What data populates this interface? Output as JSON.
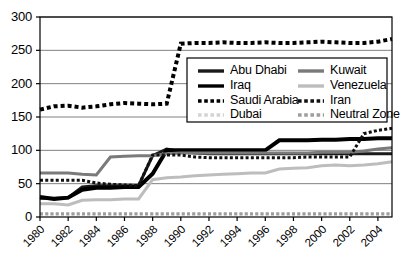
{
  "chart_data": {
    "type": "line",
    "title": "",
    "xlabel": "",
    "ylabel": "",
    "xlim": [
      1980,
      2005
    ],
    "ylim": [
      0,
      300
    ],
    "grid": true,
    "grid_axis": "y",
    "legend_position": "upper-center-right",
    "yticks": [
      "0",
      "50",
      "100",
      "150",
      "200",
      "250",
      "300"
    ],
    "ytick_values": [
      0,
      50,
      100,
      150,
      200,
      250,
      300
    ],
    "xticks": [
      "1980",
      "1982",
      "1984",
      "1986",
      "1988",
      "1990",
      "1992",
      "1994",
      "1996",
      "1998",
      "2000",
      "2002",
      "2004"
    ],
    "xtick_values": [
      1980,
      1982,
      1984,
      1986,
      1988,
      1990,
      1992,
      1994,
      1996,
      1998,
      2000,
      2002,
      2004
    ],
    "x": [
      1980,
      1981,
      1982,
      1983,
      1984,
      1985,
      1986,
      1987,
      1988,
      1989,
      1990,
      1991,
      1992,
      1993,
      1994,
      1995,
      1996,
      1997,
      1998,
      1999,
      2000,
      2001,
      2002,
      2003,
      2004,
      2005
    ],
    "series": [
      {
        "name": "Abu Dhabi",
        "color": "#1a1a1a",
        "style": "solid",
        "width": 3,
        "values": [
          28,
          28,
          29,
          45,
          47,
          47,
          47,
          47,
          92,
          102,
          98,
          96,
          95,
          95,
          95,
          95,
          95,
          95,
          95,
          95,
          95,
          95,
          95,
          95,
          95,
          95
        ]
      },
      {
        "name": "Iraq",
        "color": "#000000",
        "style": "solid",
        "width": 4,
        "values": [
          30,
          27,
          29,
          41,
          44,
          44,
          45,
          45,
          65,
          100,
          100,
          100,
          100,
          100,
          100,
          100,
          100,
          115,
          115,
          115,
          116,
          116,
          117,
          117,
          118,
          118
        ]
      },
      {
        "name": "Saudi Arabia",
        "color": "#000000",
        "style": "dotted",
        "width": 4,
        "values": [
          161,
          166,
          167,
          164,
          166,
          169,
          171,
          170,
          169,
          170,
          260,
          261,
          261,
          262,
          261,
          261,
          262,
          261,
          261,
          262,
          263,
          262,
          261,
          261,
          263,
          267
        ]
      },
      {
        "name": "Dubai",
        "color": "#d4d4d4",
        "style": "dotted",
        "width": 3,
        "values": [
          4,
          4,
          4,
          4,
          4,
          4,
          4,
          4,
          4,
          4,
          4,
          4,
          4,
          4,
          4,
          4,
          4,
          4,
          4,
          4,
          4,
          4,
          4,
          4,
          4,
          4
        ]
      },
      {
        "name": "Kuwait",
        "color": "#7a7a7a",
        "style": "solid",
        "width": 3,
        "values": [
          66,
          66,
          66,
          64,
          63,
          90,
          91,
          92,
          92,
          95,
          96,
          96,
          96,
          96,
          96,
          96,
          96,
          96,
          96,
          96,
          97,
          97,
          97,
          99,
          102,
          104
        ]
      },
      {
        "name": "Venezuela",
        "color": "#bdbdbd",
        "style": "solid",
        "width": 3,
        "values": [
          20,
          20,
          18,
          25,
          26,
          26,
          27,
          27,
          56,
          59,
          60,
          62,
          63,
          64,
          65,
          66,
          66,
          72,
          73,
          74,
          77,
          78,
          77,
          78,
          80,
          83
        ]
      },
      {
        "name": "Iran",
        "color": "#111111",
        "style": "dotted",
        "width": 3,
        "values": [
          55,
          55,
          55,
          55,
          51,
          49,
          48,
          47,
          93,
          93,
          93,
          90,
          89,
          89,
          89,
          89,
          89,
          89,
          89,
          90,
          90,
          90,
          90,
          125,
          130,
          133
        ]
      },
      {
        "name": "Neutral Zone",
        "color": "#9e9e9e",
        "style": "dotted",
        "width": 3,
        "values": [
          5,
          5,
          5,
          5,
          5,
          5,
          5,
          5,
          5,
          5,
          5,
          5,
          5,
          5,
          5,
          5,
          5,
          5,
          5,
          5,
          5,
          5,
          5,
          5,
          5,
          5
        ]
      }
    ]
  },
  "legend": {
    "entries": [
      {
        "label": "Abu Dhabi",
        "color": "#1a1a1a",
        "style": "solid"
      },
      {
        "label": "Kuwait",
        "color": "#7a7a7a",
        "style": "solid"
      },
      {
        "label": "Iraq",
        "color": "#000000",
        "style": "solid"
      },
      {
        "label": "Venezuela",
        "color": "#bdbdbd",
        "style": "solid"
      },
      {
        "label": "Saudi Arabia",
        "color": "#000000",
        "style": "dotted"
      },
      {
        "label": "Iran",
        "color": "#111111",
        "style": "dotted"
      },
      {
        "label": "Dubai",
        "color": "#d4d4d4",
        "style": "dotted"
      },
      {
        "label": "Neutral Zone",
        "color": "#9e9e9e",
        "style": "dotted"
      }
    ]
  },
  "colors": {
    "plot_border": "#000000",
    "grid_line": "#808080",
    "background": "#ffffff",
    "text": "#000000"
  }
}
